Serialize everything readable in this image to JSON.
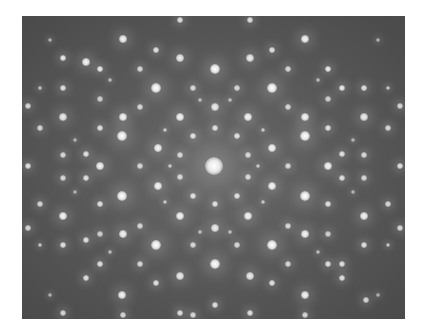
{
  "image": {
    "description": "Electron diffraction pattern with 12-fold quasicrystalline symmetry",
    "plate": {
      "x": 22,
      "y": 16,
      "width": 383,
      "height": 303
    },
    "background_color": "#555555",
    "spot_color": "#ffffff",
    "center": {
      "x": 214,
      "y": 166
    }
  },
  "spots": [
    {
      "x": 214,
      "y": 166,
      "r": 9,
      "i": 1.0
    },
    {
      "x": 215,
      "y": 69,
      "r": 5,
      "i": 1.0
    },
    {
      "x": 156,
      "y": 88,
      "r": 5,
      "i": 1.0
    },
    {
      "x": 272,
      "y": 88,
      "r": 5,
      "i": 1.0
    },
    {
      "x": 123,
      "y": 117,
      "r": 4,
      "i": 0.95
    },
    {
      "x": 305,
      "y": 117,
      "r": 4,
      "i": 0.95
    },
    {
      "x": 63,
      "y": 117,
      "r": 4,
      "i": 0.9
    },
    {
      "x": 364,
      "y": 117,
      "r": 4,
      "i": 0.9
    },
    {
      "x": 180,
      "y": 117,
      "r": 4,
      "i": 0.95
    },
    {
      "x": 248,
      "y": 117,
      "r": 4,
      "i": 0.95
    },
    {
      "x": 122,
      "y": 136,
      "r": 5,
      "i": 1.0
    },
    {
      "x": 305,
      "y": 136,
      "r": 5,
      "i": 1.0
    },
    {
      "x": 158,
      "y": 148,
      "r": 4,
      "i": 0.95
    },
    {
      "x": 272,
      "y": 148,
      "r": 4,
      "i": 0.95
    },
    {
      "x": 100,
      "y": 166,
      "r": 4,
      "i": 0.95
    },
    {
      "x": 328,
      "y": 166,
      "r": 4,
      "i": 0.95
    },
    {
      "x": 28,
      "y": 166,
      "r": 3,
      "i": 0.85
    },
    {
      "x": 400,
      "y": 166,
      "r": 3,
      "i": 0.85
    },
    {
      "x": 122,
      "y": 196,
      "r": 5,
      "i": 1.0
    },
    {
      "x": 305,
      "y": 196,
      "r": 5,
      "i": 1.0
    },
    {
      "x": 158,
      "y": 186,
      "r": 4,
      "i": 0.95
    },
    {
      "x": 272,
      "y": 186,
      "r": 4,
      "i": 0.95
    },
    {
      "x": 63,
      "y": 216,
      "r": 4,
      "i": 0.95
    },
    {
      "x": 364,
      "y": 216,
      "r": 4,
      "i": 0.95
    },
    {
      "x": 180,
      "y": 216,
      "r": 4,
      "i": 0.95
    },
    {
      "x": 248,
      "y": 216,
      "r": 4,
      "i": 0.95
    },
    {
      "x": 156,
      "y": 245,
      "r": 5,
      "i": 1.0
    },
    {
      "x": 272,
      "y": 245,
      "r": 5,
      "i": 1.0
    },
    {
      "x": 215,
      "y": 264,
      "r": 5,
      "i": 1.0
    },
    {
      "x": 123,
      "y": 234,
      "r": 4,
      "i": 0.95
    },
    {
      "x": 305,
      "y": 234,
      "r": 4,
      "i": 0.95
    },
    {
      "x": 122,
      "y": 295,
      "r": 4,
      "i": 0.95
    },
    {
      "x": 305,
      "y": 295,
      "r": 4,
      "i": 0.95
    },
    {
      "x": 63,
      "y": 58,
      "r": 3,
      "i": 0.9
    },
    {
      "x": 123,
      "y": 39,
      "r": 4,
      "i": 0.95
    },
    {
      "x": 305,
      "y": 39,
      "r": 4,
      "i": 0.95
    },
    {
      "x": 180,
      "y": 20,
      "r": 3,
      "i": 0.85
    },
    {
      "x": 250,
      "y": 20,
      "r": 3,
      "i": 0.85
    },
    {
      "x": 100,
      "y": 69,
      "r": 3,
      "i": 0.9
    },
    {
      "x": 328,
      "y": 69,
      "r": 3,
      "i": 0.9
    },
    {
      "x": 86,
      "y": 62,
      "r": 4,
      "i": 0.95
    },
    {
      "x": 342,
      "y": 88,
      "r": 3,
      "i": 0.9
    },
    {
      "x": 180,
      "y": 58,
      "r": 4,
      "i": 0.9
    },
    {
      "x": 250,
      "y": 58,
      "r": 4,
      "i": 0.9
    },
    {
      "x": 156,
      "y": 50,
      "r": 3,
      "i": 0.85
    },
    {
      "x": 272,
      "y": 50,
      "r": 3,
      "i": 0.85
    },
    {
      "x": 215,
      "y": 107,
      "r": 4,
      "i": 0.9
    },
    {
      "x": 215,
      "y": 128,
      "r": 3,
      "i": 0.85
    },
    {
      "x": 215,
      "y": 204,
      "r": 3,
      "i": 0.85
    },
    {
      "x": 215,
      "y": 228,
      "r": 4,
      "i": 0.9
    },
    {
      "x": 193,
      "y": 136,
      "r": 3,
      "i": 0.85
    },
    {
      "x": 237,
      "y": 136,
      "r": 3,
      "i": 0.85
    },
    {
      "x": 193,
      "y": 196,
      "r": 3,
      "i": 0.85
    },
    {
      "x": 237,
      "y": 196,
      "r": 3,
      "i": 0.85
    },
    {
      "x": 180,
      "y": 155,
      "r": 3,
      "i": 0.8
    },
    {
      "x": 248,
      "y": 155,
      "r": 3,
      "i": 0.8
    },
    {
      "x": 180,
      "y": 177,
      "r": 3,
      "i": 0.8
    },
    {
      "x": 248,
      "y": 177,
      "r": 3,
      "i": 0.8
    },
    {
      "x": 86,
      "y": 154,
      "r": 3,
      "i": 0.85
    },
    {
      "x": 342,
      "y": 154,
      "r": 3,
      "i": 0.85
    },
    {
      "x": 86,
      "y": 178,
      "r": 3,
      "i": 0.85
    },
    {
      "x": 342,
      "y": 178,
      "r": 3,
      "i": 0.85
    },
    {
      "x": 63,
      "y": 155,
      "r": 3,
      "i": 0.8
    },
    {
      "x": 364,
      "y": 155,
      "r": 3,
      "i": 0.8
    },
    {
      "x": 63,
      "y": 178,
      "r": 3,
      "i": 0.8
    },
    {
      "x": 364,
      "y": 178,
      "r": 3,
      "i": 0.8
    },
    {
      "x": 100,
      "y": 128,
      "r": 3,
      "i": 0.85
    },
    {
      "x": 328,
      "y": 128,
      "r": 3,
      "i": 0.85
    },
    {
      "x": 100,
      "y": 204,
      "r": 3,
      "i": 0.85
    },
    {
      "x": 328,
      "y": 204,
      "r": 3,
      "i": 0.85
    },
    {
      "x": 40,
      "y": 128,
      "r": 3,
      "i": 0.8
    },
    {
      "x": 388,
      "y": 128,
      "r": 3,
      "i": 0.8
    },
    {
      "x": 40,
      "y": 204,
      "r": 3,
      "i": 0.8
    },
    {
      "x": 388,
      "y": 204,
      "r": 3,
      "i": 0.8
    },
    {
      "x": 28,
      "y": 106,
      "r": 3,
      "i": 0.8
    },
    {
      "x": 400,
      "y": 106,
      "r": 3,
      "i": 0.8
    },
    {
      "x": 28,
      "y": 228,
      "r": 3,
      "i": 0.8
    },
    {
      "x": 400,
      "y": 228,
      "r": 3,
      "i": 0.8
    },
    {
      "x": 63,
      "y": 88,
      "r": 3,
      "i": 0.85
    },
    {
      "x": 364,
      "y": 88,
      "r": 3,
      "i": 0.85
    },
    {
      "x": 63,
      "y": 245,
      "r": 3,
      "i": 0.85
    },
    {
      "x": 364,
      "y": 245,
      "r": 3,
      "i": 0.85
    },
    {
      "x": 86,
      "y": 240,
      "r": 3,
      "i": 0.85
    },
    {
      "x": 342,
      "y": 264,
      "r": 3,
      "i": 0.85
    },
    {
      "x": 100,
      "y": 264,
      "r": 3,
      "i": 0.85
    },
    {
      "x": 328,
      "y": 264,
      "r": 3,
      "i": 0.85
    },
    {
      "x": 86,
      "y": 278,
      "r": 3,
      "i": 0.85
    },
    {
      "x": 342,
      "y": 278,
      "r": 3,
      "i": 0.85
    },
    {
      "x": 156,
      "y": 283,
      "r": 3,
      "i": 0.85
    },
    {
      "x": 272,
      "y": 283,
      "r": 3,
      "i": 0.85
    },
    {
      "x": 180,
      "y": 276,
      "r": 4,
      "i": 0.9
    },
    {
      "x": 250,
      "y": 276,
      "r": 4,
      "i": 0.9
    },
    {
      "x": 180,
      "y": 313,
      "r": 3,
      "i": 0.85
    },
    {
      "x": 250,
      "y": 313,
      "r": 3,
      "i": 0.85
    },
    {
      "x": 215,
      "y": 305,
      "r": 3,
      "i": 0.85
    },
    {
      "x": 193,
      "y": 315,
      "r": 3,
      "i": 0.8
    },
    {
      "x": 63,
      "y": 313,
      "r": 3,
      "i": 0.8
    },
    {
      "x": 366,
      "y": 300,
      "r": 3,
      "i": 0.8
    },
    {
      "x": 123,
      "y": 315,
      "r": 3,
      "i": 0.8
    },
    {
      "x": 305,
      "y": 315,
      "r": 3,
      "i": 0.8
    },
    {
      "x": 140,
      "y": 107,
      "r": 3,
      "i": 0.8
    },
    {
      "x": 288,
      "y": 107,
      "r": 3,
      "i": 0.8
    },
    {
      "x": 140,
      "y": 226,
      "r": 3,
      "i": 0.8
    },
    {
      "x": 288,
      "y": 226,
      "r": 3,
      "i": 0.8
    },
    {
      "x": 140,
      "y": 166,
      "r": 3,
      "i": 0.8
    },
    {
      "x": 288,
      "y": 166,
      "r": 3,
      "i": 0.8
    },
    {
      "x": 193,
      "y": 88,
      "r": 3,
      "i": 0.8
    },
    {
      "x": 237,
      "y": 88,
      "r": 3,
      "i": 0.8
    },
    {
      "x": 193,
      "y": 245,
      "r": 3,
      "i": 0.8
    },
    {
      "x": 237,
      "y": 245,
      "r": 3,
      "i": 0.8
    },
    {
      "x": 140,
      "y": 69,
      "r": 3,
      "i": 0.8
    },
    {
      "x": 288,
      "y": 69,
      "r": 3,
      "i": 0.8
    },
    {
      "x": 140,
      "y": 264,
      "r": 3,
      "i": 0.8
    },
    {
      "x": 288,
      "y": 264,
      "r": 3,
      "i": 0.8
    },
    {
      "x": 100,
      "y": 99,
      "r": 3,
      "i": 0.75
    },
    {
      "x": 328,
      "y": 99,
      "r": 3,
      "i": 0.75
    },
    {
      "x": 100,
      "y": 234,
      "r": 3,
      "i": 0.75
    },
    {
      "x": 328,
      "y": 234,
      "r": 3,
      "i": 0.75
    },
    {
      "x": 40,
      "y": 88,
      "r": 2,
      "i": 0.7
    },
    {
      "x": 388,
      "y": 88,
      "r": 2,
      "i": 0.7
    },
    {
      "x": 40,
      "y": 245,
      "r": 2,
      "i": 0.7
    },
    {
      "x": 388,
      "y": 245,
      "r": 2,
      "i": 0.7
    },
    {
      "x": 170,
      "y": 166,
      "r": 2,
      "i": 0.7
    },
    {
      "x": 258,
      "y": 166,
      "r": 2,
      "i": 0.7
    },
    {
      "x": 165,
      "y": 130,
      "r": 2,
      "i": 0.7
    },
    {
      "x": 263,
      "y": 130,
      "r": 2,
      "i": 0.7
    },
    {
      "x": 165,
      "y": 202,
      "r": 2,
      "i": 0.7
    },
    {
      "x": 263,
      "y": 202,
      "r": 2,
      "i": 0.7
    },
    {
      "x": 200,
      "y": 100,
      "r": 2,
      "i": 0.65
    },
    {
      "x": 230,
      "y": 100,
      "r": 2,
      "i": 0.65
    },
    {
      "x": 200,
      "y": 232,
      "r": 2,
      "i": 0.65
    },
    {
      "x": 230,
      "y": 232,
      "r": 2,
      "i": 0.65
    },
    {
      "x": 110,
      "y": 80,
      "r": 2,
      "i": 0.65
    },
    {
      "x": 318,
      "y": 80,
      "r": 2,
      "i": 0.65
    },
    {
      "x": 110,
      "y": 252,
      "r": 2,
      "i": 0.65
    },
    {
      "x": 318,
      "y": 252,
      "r": 2,
      "i": 0.65
    },
    {
      "x": 75,
      "y": 140,
      "r": 2,
      "i": 0.6
    },
    {
      "x": 353,
      "y": 140,
      "r": 2,
      "i": 0.6
    },
    {
      "x": 75,
      "y": 192,
      "r": 2,
      "i": 0.6
    },
    {
      "x": 353,
      "y": 192,
      "r": 2,
      "i": 0.6
    },
    {
      "x": 50,
      "y": 295,
      "r": 2,
      "i": 0.6
    },
    {
      "x": 378,
      "y": 40,
      "r": 2,
      "i": 0.6
    },
    {
      "x": 50,
      "y": 40,
      "r": 2,
      "i": 0.6
    },
    {
      "x": 378,
      "y": 295,
      "r": 2,
      "i": 0.6
    }
  ]
}
